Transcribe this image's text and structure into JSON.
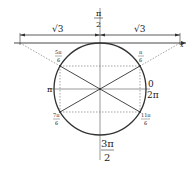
{
  "diagram": {
    "colors": {
      "stroke": "#333333",
      "dashed": "#666666",
      "text": "#222222",
      "background": "#ffffff"
    },
    "dimension_labels": {
      "left": "√3",
      "right": "√3"
    },
    "axis_labels": {
      "top": {
        "num": "π",
        "den": "2"
      },
      "bottom": {
        "num": "3π",
        "den": "2"
      },
      "left": "π",
      "right_top": "0",
      "right_bottom": "2π",
      "x_axis": "x"
    },
    "point_labels": {
      "p30": {
        "num": "π",
        "den": "6"
      },
      "p150": {
        "num": "5π",
        "den": "6"
      },
      "p210": {
        "num": "7π",
        "den": "6"
      },
      "p330": {
        "num": "11π",
        "den": "6"
      }
    }
  }
}
